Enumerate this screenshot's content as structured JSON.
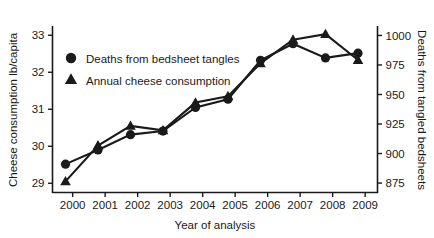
{
  "chart_data": {
    "type": "line",
    "title": "",
    "subtitle": "",
    "xlabel": "Year of analysis",
    "ylabel": "Cheese consumption lb/capita",
    "y2label": "Deaths from tangled bedsheets",
    "categories": [
      "2000",
      "2001",
      "2002",
      "2003",
      "2004",
      "2005",
      "2006",
      "2007",
      "2008",
      "2009"
    ],
    "x": [
      2000,
      2001,
      2002,
      2003,
      2004,
      2005,
      2006,
      2007,
      2008,
      2009
    ],
    "xlim": [
      1999.6,
      2009.6
    ],
    "ylim": [
      28.75,
      33.25
    ],
    "y2lim": [
      867,
      1008
    ],
    "yticks": [
      29,
      30,
      31,
      32,
      33
    ],
    "ytick_labels": [
      "29",
      "30",
      "31",
      "32",
      "33"
    ],
    "y2ticks": [
      875,
      900,
      925,
      950,
      975,
      1000
    ],
    "y2tick_labels": [
      "875",
      "900",
      "925",
      "950",
      "975",
      "1000"
    ],
    "xticks": [
      2000,
      2001,
      2002,
      2003,
      2004,
      2005,
      2006,
      2007,
      2008,
      2009
    ],
    "xtick_labels": [
      "2000",
      "2001",
      "2002",
      "2003",
      "2004",
      "2005",
      "2006",
      "2007",
      "2008",
      "2009"
    ],
    "grid": false,
    "legend_position": "upper left",
    "series": [
      {
        "name": "Deaths from bedsheet tangles",
        "marker": "circle",
        "axis": "right",
        "color": "#1a1a1a",
        "values": [
          891,
          903,
          916,
          919,
          939,
          946,
          979,
          993,
          981,
          985
        ]
      },
      {
        "name": "Annual cheese consumption",
        "marker": "triangle",
        "axis": "left",
        "color": "#1a1a1a",
        "values": [
          29.05,
          30.02,
          30.55,
          30.43,
          31.18,
          31.35,
          32.24,
          32.88,
          33.03,
          32.33
        ]
      }
    ],
    "annotations": []
  },
  "legend": {
    "items": [
      {
        "label": "Deaths from bedsheet tangles",
        "marker": "circle"
      },
      {
        "label": "Annual cheese consumption",
        "marker": "triangle"
      }
    ]
  },
  "axes": {
    "left": {
      "title": "Cheese consumption lb/capita"
    },
    "right": {
      "title": "Deaths from tangled bedsheets"
    },
    "bottom": {
      "title": "Year of analysis"
    }
  }
}
